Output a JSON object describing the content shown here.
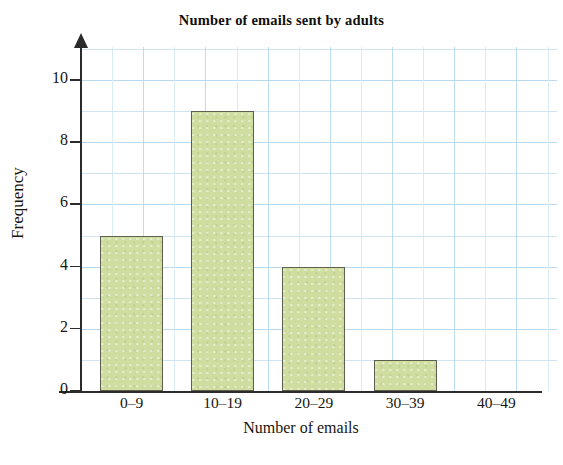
{
  "chart_data": {
    "type": "bar",
    "title": "Number of emails sent by adults",
    "xlabel": "Number of emails",
    "ylabel": "Frequency",
    "categories": [
      "0–9",
      "10–19",
      "20–29",
      "30–39",
      "40–49"
    ],
    "values": [
      5,
      9,
      4,
      1,
      0
    ],
    "ylim": [
      0,
      11
    ],
    "y_ticks": [
      0,
      2,
      4,
      6,
      8,
      10
    ],
    "y_tick_labels": [
      "0",
      "2",
      "4",
      "6",
      "8",
      "10"
    ],
    "grid": true,
    "grid_color": "#b9d9ee",
    "legend": null,
    "bar_fill_color": "#cfdda1",
    "bar_edge_color": "#5e5f4c",
    "axis_color": "#2b2b2b"
  }
}
